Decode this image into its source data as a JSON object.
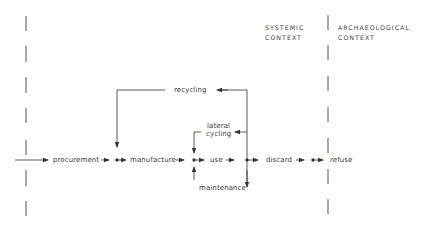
{
  "headers": {
    "systemic": [
      "SYSTEMIC",
      "CONTEXT"
    ],
    "archaeological": [
      "ARCHAEOLOGICAL",
      "CONTEXT"
    ]
  },
  "nodes": {
    "procurement": "procurement",
    "manufacture": "manufacture",
    "use": "use",
    "discard": "discard",
    "refuse": "refuse"
  },
  "loops": {
    "recycling": "recycling",
    "lateral_cycling_1": "lateral",
    "lateral_cycling_2": "cycling",
    "maintenance": "maintenance"
  },
  "colors": {
    "line": "#333333",
    "text": "#3a3a3a",
    "background": "#ffffff"
  }
}
